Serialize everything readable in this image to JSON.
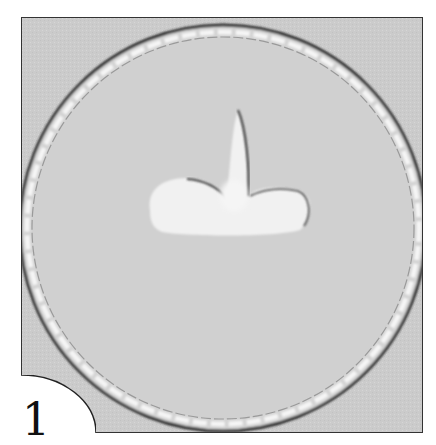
{
  "figure": {
    "step_number": "1",
    "colors": {
      "background": "#ffffff",
      "frame_fill": "#c9c9c9",
      "board_fill": "#d2d2d2",
      "icing": "#f2f2f2",
      "outline": "#333333"
    }
  }
}
